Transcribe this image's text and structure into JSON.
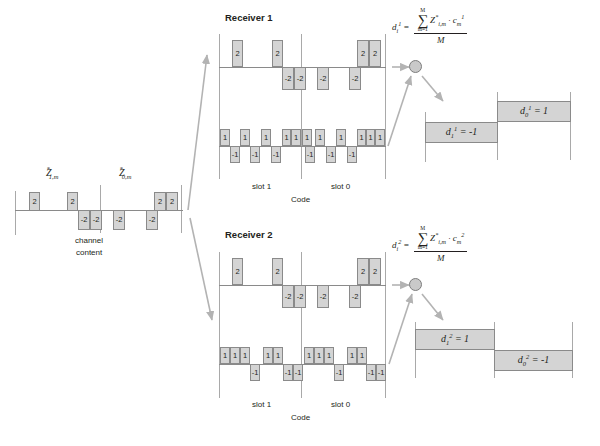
{
  "figure": {
    "colors": {
      "block_fill": "#d4d4d4",
      "block_stroke": "#8a8a8a",
      "axis": "#a9a9a9",
      "arrow": "#b3b3b3",
      "text": "#231f20"
    }
  },
  "channel": {
    "label_z1": "Z",
    "label_z1_sub": "1,m",
    "label_z0": "Z",
    "label_z0_sub": "0,m",
    "star": "*",
    "caption_line1": "channel",
    "caption_line2": "content",
    "values": [
      "2",
      "2",
      "-2",
      "-2",
      "-2",
      "-2",
      "2",
      "2"
    ],
    "sequence": [
      2,
      0,
      2,
      -2,
      -2,
      0,
      -2,
      0,
      -2,
      2,
      2
    ]
  },
  "receiver1": {
    "title": "Receiver 1",
    "signal_values": [
      "2",
      "2",
      "-2",
      "-2",
      "-2",
      "-2",
      "2",
      "2"
    ],
    "code_values": [
      "1",
      "-1",
      "1",
      "-1",
      "1",
      "-1",
      "1",
      "1",
      "1",
      "1",
      "-1",
      "1",
      "-1",
      "1",
      "-1",
      "1",
      "1"
    ],
    "slot1_label": "slot 1",
    "slot0_label": "slot 0",
    "code_label": "Code",
    "formula": {
      "lhs": "d",
      "lhs_sub": "i",
      "lhs_sup": "1",
      "eq": "=",
      "sigma_upper": "M",
      "sigma_lower": "m=1",
      "numerator": "Z",
      "num_sub": "i,m",
      "num_star": "*",
      "dot": "·",
      "code_sym": "c",
      "code_sub": "m",
      "code_sup": "1",
      "denominator": "M"
    },
    "out_slot1": {
      "sym": "d",
      "sub": "1",
      "sup": "1",
      "eq": "= -1"
    },
    "out_slot0": {
      "sym": "d",
      "sub": "0",
      "sup": "1",
      "eq": "= 1"
    }
  },
  "receiver2": {
    "title": "Receiver 2",
    "signal_values": [
      "2",
      "2",
      "-2",
      "-2",
      "-2",
      "-2",
      "2",
      "2"
    ],
    "code_values": [
      "1",
      "1",
      "1",
      "-1",
      "1",
      "1",
      "-1",
      "-1",
      "1",
      "1",
      "1",
      "-1",
      "1",
      "1",
      "-1",
      "-1"
    ],
    "slot1_label": "slot 1",
    "slot0_label": "slot 0",
    "code_label": "Code",
    "formula": {
      "lhs": "d",
      "lhs_sub": "i",
      "lhs_sup": "2",
      "eq": "=",
      "sigma_upper": "M",
      "sigma_lower": "m=1",
      "numerator": "Z",
      "num_sub": "i,m",
      "num_star": "*",
      "dot": "·",
      "code_sym": "c",
      "code_sub": "m",
      "code_sup": "2",
      "denominator": "M"
    },
    "out_slot1": {
      "sym": "d",
      "sub": "1",
      "sup": "2",
      "eq": "= 1"
    },
    "out_slot0": {
      "sym": "d",
      "sub": "0",
      "sup": "2",
      "eq": "= -1"
    }
  }
}
